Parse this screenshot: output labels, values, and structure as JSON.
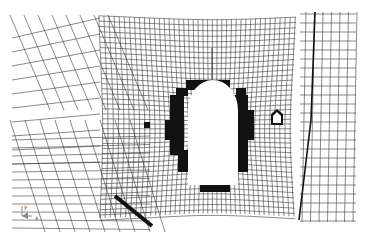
{
  "figure": {
    "colors": {
      "background": "#ffffff",
      "mesh_line": "#3a3a3a",
      "failed_zone": "#111111",
      "opening": "#ffffff",
      "triad": "#888888"
    },
    "axis_triad": {
      "y_label": "y",
      "x_label": "x"
    }
  }
}
